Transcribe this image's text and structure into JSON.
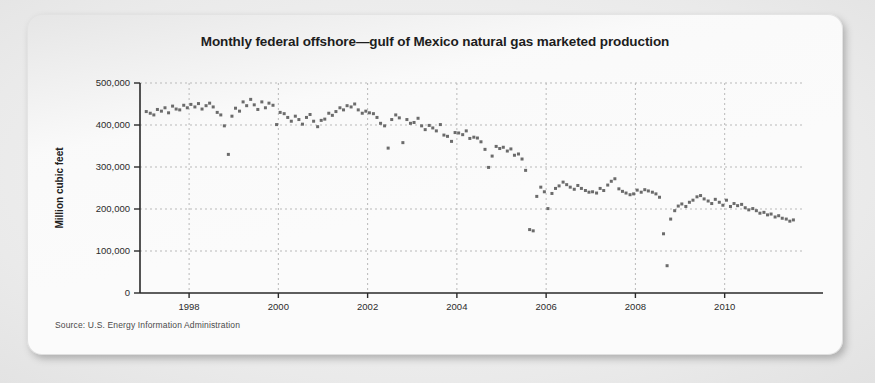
{
  "figure": {
    "title": "Monthly federal offshore—gulf of Mexico natural gas marketed production",
    "source": "Source: U.S. Energy Information Administration"
  },
  "chart_data": {
    "type": "scatter",
    "title": "Monthly federal offshore—gulf of Mexico natural gas marketed production",
    "xlabel": "",
    "ylabel": "Million cubic feet",
    "xlim": [
      1996.9,
      2011.8
    ],
    "ylim": [
      0,
      500000
    ],
    "grid": true,
    "legend": false,
    "marker": "square",
    "marker_color": "#6b6b6b",
    "marker_size": 3,
    "ytick_labels": [
      "0",
      "100,000",
      "200,000",
      "300,000",
      "400,000",
      "500,000"
    ],
    "yticks": [
      0,
      100000,
      200000,
      300000,
      400000,
      500000
    ],
    "xtick_labels": [
      "1998",
      "2000",
      "2002",
      "2004",
      "2006",
      "2008",
      "2010"
    ],
    "xticks": [
      1998,
      2000,
      2002,
      2004,
      2006,
      2008,
      2010
    ],
    "series": [
      {
        "name": "Gulf of Mexico federal offshore natural gas marketed production",
        "x": [
          1997.04,
          1997.13,
          1997.21,
          1997.29,
          1997.38,
          1997.46,
          1997.54,
          1997.63,
          1997.71,
          1997.79,
          1997.88,
          1997.96,
          1998.04,
          1998.13,
          1998.21,
          1998.29,
          1998.38,
          1998.46,
          1998.54,
          1998.63,
          1998.71,
          1998.79,
          1998.88,
          1998.96,
          1999.04,
          1999.13,
          1999.21,
          1999.29,
          1999.38,
          1999.46,
          1999.54,
          1999.63,
          1999.71,
          1999.79,
          1999.88,
          1999.96,
          2000.04,
          2000.13,
          2000.21,
          2000.29,
          2000.38,
          2000.46,
          2000.54,
          2000.63,
          2000.71,
          2000.79,
          2000.88,
          2000.96,
          2001.04,
          2001.13,
          2001.21,
          2001.29,
          2001.38,
          2001.46,
          2001.54,
          2001.63,
          2001.71,
          2001.79,
          2001.88,
          2001.96,
          2002.04,
          2002.13,
          2002.21,
          2002.29,
          2002.38,
          2002.46,
          2002.54,
          2002.63,
          2002.71,
          2002.79,
          2002.88,
          2002.96,
          2003.04,
          2003.13,
          2003.21,
          2003.29,
          2003.38,
          2003.46,
          2003.54,
          2003.63,
          2003.71,
          2003.79,
          2003.88,
          2003.96,
          2004.04,
          2004.13,
          2004.21,
          2004.29,
          2004.38,
          2004.46,
          2004.54,
          2004.63,
          2004.71,
          2004.79,
          2004.88,
          2004.96,
          2005.04,
          2005.13,
          2005.21,
          2005.29,
          2005.38,
          2005.46,
          2005.54,
          2005.63,
          2005.71,
          2005.79,
          2005.88,
          2005.96,
          2006.04,
          2006.13,
          2006.21,
          2006.29,
          2006.38,
          2006.46,
          2006.54,
          2006.63,
          2006.71,
          2006.79,
          2006.88,
          2006.96,
          2007.04,
          2007.13,
          2007.21,
          2007.29,
          2007.38,
          2007.46,
          2007.54,
          2007.63,
          2007.71,
          2007.79,
          2007.88,
          2007.96,
          2008.04,
          2008.13,
          2008.21,
          2008.29,
          2008.38,
          2008.46,
          2008.54,
          2008.63,
          2008.71,
          2008.79,
          2008.88,
          2008.96,
          2009.04,
          2009.13,
          2009.21,
          2009.29,
          2009.38,
          2009.46,
          2009.54,
          2009.63,
          2009.71,
          2009.79,
          2009.88,
          2009.96,
          2010.04,
          2010.13,
          2010.21,
          2010.29,
          2010.38,
          2010.46,
          2010.54,
          2010.63,
          2010.71,
          2010.79,
          2010.88,
          2010.96,
          2011.04,
          2011.13,
          2011.21,
          2011.29,
          2011.38,
          2011.46,
          2011.54
        ],
        "y": [
          432000,
          428000,
          424000,
          437000,
          433000,
          441000,
          429000,
          445000,
          438000,
          436000,
          447000,
          441000,
          449000,
          443000,
          451000,
          438000,
          446000,
          452000,
          443000,
          430000,
          424000,
          398000,
          330000,
          421000,
          440000,
          433000,
          455000,
          446000,
          461000,
          448000,
          437000,
          455000,
          441000,
          452000,
          447000,
          401000,
          430000,
          427000,
          418000,
          409000,
          421000,
          413000,
          402000,
          418000,
          425000,
          409000,
          396000,
          411000,
          414000,
          428000,
          423000,
          432000,
          441000,
          436000,
          446000,
          443000,
          450000,
          436000,
          428000,
          433000,
          429000,
          427000,
          418000,
          404000,
          398000,
          345000,
          413000,
          424000,
          417000,
          358000,
          413000,
          404000,
          406000,
          416000,
          398000,
          389000,
          399000,
          393000,
          386000,
          401000,
          376000,
          373000,
          361000,
          382000,
          381000,
          377000,
          386000,
          368000,
          371000,
          369000,
          360000,
          342000,
          299000,
          326000,
          349000,
          344000,
          347000,
          338000,
          343000,
          328000,
          331000,
          319000,
          292000,
          151000,
          148000,
          230000,
          252000,
          241000,
          201000,
          237000,
          249000,
          255000,
          264000,
          258000,
          252000,
          247000,
          256000,
          249000,
          244000,
          240000,
          241000,
          238000,
          249000,
          244000,
          257000,
          266000,
          272000,
          248000,
          242000,
          238000,
          234000,
          236000,
          245000,
          240000,
          246000,
          243000,
          240000,
          236000,
          228000,
          141000,
          65000,
          176000,
          196000,
          207000,
          212000,
          206000,
          216000,
          221000,
          229000,
          232000,
          224000,
          219000,
          213000,
          223000,
          216000,
          209000,
          221000,
          206000,
          213000,
          208000,
          211000,
          203000,
          198000,
          201000,
          196000,
          190000,
          192000,
          186000,
          188000,
          181000,
          184000,
          178000,
          176000,
          171000,
          174000
        ]
      }
    ],
    "annotations": [
      {
        "label": "hurricane shut-in dip",
        "x": 1998.88,
        "y": 330000
      },
      {
        "label": "hurricanes Katrina/Rita shut-in",
        "x": 2005.71,
        "y": 148000
      },
      {
        "label": "hurricanes Gustav/Ike shut-in",
        "x": 2008.71,
        "y": 65000
      }
    ]
  }
}
